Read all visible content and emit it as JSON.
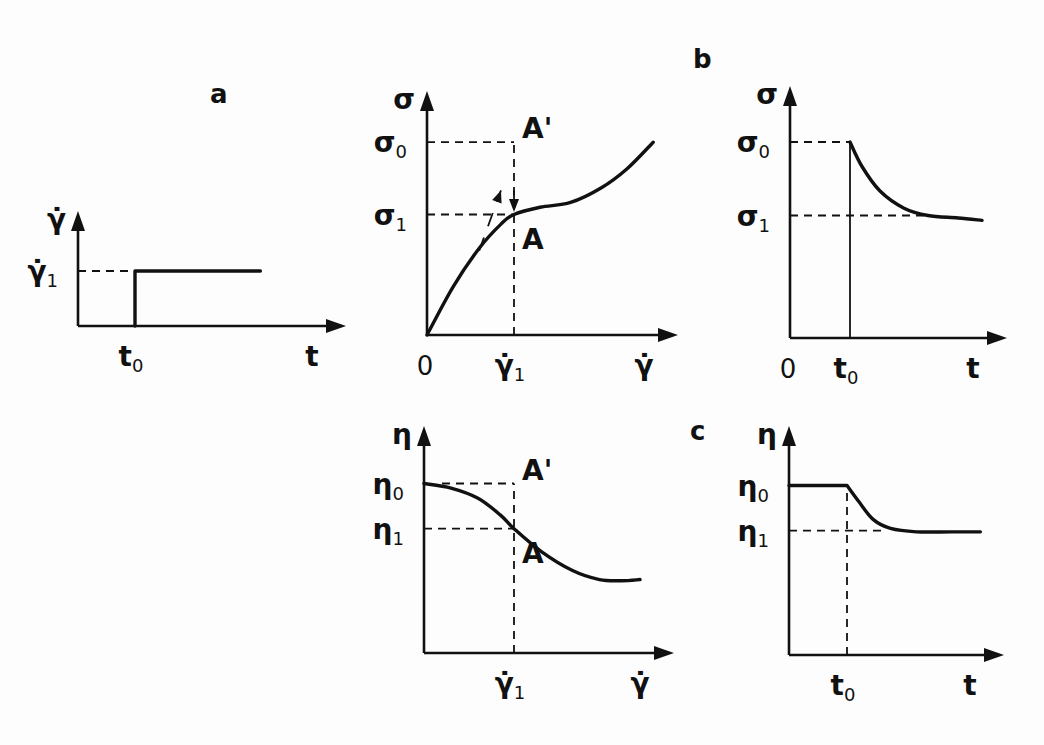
{
  "chart_data": [
    {
      "id": "a",
      "panel_label": "a",
      "type": "line",
      "title": "Step in shear rate",
      "xlabel": "t",
      "ylabel": "γ̇",
      "x_ticks": [
        {
          "label": "t",
          "sub": "0",
          "x": 1
        }
      ],
      "y_ticks": [
        {
          "label": "γ̇",
          "sub": "1",
          "y": 1
        }
      ],
      "xlim": [
        0,
        3.5
      ],
      "ylim": [
        0,
        2
      ],
      "series": [
        {
          "name": "shear rate",
          "x": [
            1,
            1,
            3.2
          ],
          "y": [
            0,
            1,
            1
          ]
        }
      ],
      "guides": [
        {
          "kind": "hline-dashed",
          "y": 1,
          "from_x": 0,
          "to_x": 1
        }
      ]
    },
    {
      "id": "b-left",
      "panel_label": "b",
      "type": "line",
      "title": "Flow curve",
      "xlabel": "γ̇",
      "ylabel": "σ",
      "origin_label": "0",
      "x_ticks": [
        {
          "label": "γ̇",
          "sub": "1",
          "x": 1
        }
      ],
      "y_ticks": [
        {
          "label": "σ",
          "sub": "0",
          "y": 1.6
        },
        {
          "label": "σ",
          "sub": "1",
          "y": 1
        }
      ],
      "xlim": [
        0,
        2.85
      ],
      "ylim": [
        0,
        2.0
      ],
      "series": [
        {
          "name": "flow curve",
          "x": [
            0,
            0.3,
            0.6,
            0.85,
            1,
            1.3,
            1.65,
            2.0,
            2.3,
            2.6
          ],
          "y": [
            0,
            0.4,
            0.72,
            0.92,
            1,
            1.06,
            1.1,
            1.22,
            1.38,
            1.6
          ]
        }
      ],
      "annotations": [
        {
          "text": "A'",
          "x": 1,
          "y": 1.6
        },
        {
          "text": "A",
          "x": 1,
          "y": 1
        }
      ],
      "guides": [
        {
          "kind": "hline-dashed",
          "y": 1.6,
          "from_x": 0,
          "to_x": 1
        },
        {
          "kind": "hline-dashed",
          "y": 1,
          "from_x": 0,
          "to_x": 1
        },
        {
          "kind": "vline-dashed",
          "x": 1,
          "from_y": 0,
          "to_y": 1.6
        },
        {
          "kind": "arrow-down",
          "x": 1,
          "from_y": 1.2,
          "to_y": 1.02
        },
        {
          "kind": "tangent-dashed-arrow",
          "points": [
            [
              0.6,
              0.7
            ],
            [
              0.85,
              1.2
            ]
          ]
        }
      ]
    },
    {
      "id": "b-right",
      "type": "line",
      "title": "Stress response",
      "xlabel": "t",
      "ylabel": "σ",
      "origin_label": "0",
      "x_ticks": [
        {
          "label": "t",
          "sub": "0",
          "x": 1
        }
      ],
      "y_ticks": [
        {
          "label": "σ",
          "sub": "0",
          "y": 1.6
        },
        {
          "label": "σ",
          "sub": "1",
          "y": 1
        }
      ],
      "xlim": [
        0,
        3.5
      ],
      "ylim": [
        0,
        2.0
      ],
      "series": [
        {
          "name": "stress",
          "x": [
            1,
            1,
            1.2,
            1.5,
            1.9,
            2.3,
            2.8,
            3.2
          ],
          "y": [
            0,
            1.6,
            1.4,
            1.2,
            1.06,
            1.0,
            0.98,
            0.96
          ]
        }
      ],
      "guides": [
        {
          "kind": "hline-dashed",
          "y": 1.6,
          "from_x": 0,
          "to_x": 1
        },
        {
          "kind": "hline-dashed",
          "y": 1,
          "from_x": 0,
          "to_x": 2.3
        }
      ]
    },
    {
      "id": "c-left",
      "panel_label": "c",
      "type": "line",
      "title": "Viscosity curve",
      "xlabel": "γ̇",
      "ylabel": "η",
      "x_ticks": [
        {
          "label": "γ̇",
          "sub": "1",
          "x": 1
        }
      ],
      "y_ticks": [
        {
          "label": "η",
          "sub": "0",
          "y": 1.5
        },
        {
          "label": "η",
          "sub": "1",
          "y": 1.1
        }
      ],
      "xlim": [
        0,
        2.85
      ],
      "ylim": [
        0,
        2.0
      ],
      "series": [
        {
          "name": "viscosity",
          "x": [
            0,
            0.3,
            0.6,
            0.85,
            1,
            1.3,
            1.65,
            1.95,
            2.2,
            2.4
          ],
          "y": [
            1.5,
            1.46,
            1.37,
            1.22,
            1.1,
            0.9,
            0.73,
            0.65,
            0.64,
            0.65
          ]
        }
      ],
      "annotations": [
        {
          "text": "A'",
          "x": 1,
          "y": 1.5
        },
        {
          "text": "A",
          "x": 1,
          "y": 1.1
        }
      ],
      "guides": [
        {
          "kind": "hline-dashed",
          "y": 1.5,
          "from_x": 0.2,
          "to_x": 1
        },
        {
          "kind": "hline-dashed",
          "y": 1.1,
          "from_x": 0,
          "to_x": 1
        },
        {
          "kind": "vline-dashed",
          "x": 1,
          "from_y": 0,
          "to_y": 1.5
        }
      ]
    },
    {
      "id": "c-right",
      "type": "line",
      "title": "Viscosity response",
      "xlabel": "t",
      "ylabel": "η",
      "x_ticks": [
        {
          "label": "t",
          "sub": "0",
          "x": 1
        }
      ],
      "y_ticks": [
        {
          "label": "η",
          "sub": "0",
          "y": 1.5
        },
        {
          "label": "η",
          "sub": "1",
          "y": 1.1
        }
      ],
      "xlim": [
        0,
        3.5
      ],
      "ylim": [
        0,
        2.0
      ],
      "series": [
        {
          "name": "viscosity",
          "x": [
            0,
            1,
            1.2,
            1.45,
            1.75,
            2.2,
            2.8,
            3.3
          ],
          "y": [
            1.5,
            1.5,
            1.36,
            1.2,
            1.12,
            1.09,
            1.09,
            1.09
          ]
        }
      ],
      "guides": [
        {
          "kind": "hline-dashed",
          "y": 1.1,
          "from_x": 0,
          "to_x": 1.6
        },
        {
          "kind": "vline-dashed",
          "x": 1,
          "from_y": 0,
          "to_y": 1.5
        }
      ]
    }
  ]
}
